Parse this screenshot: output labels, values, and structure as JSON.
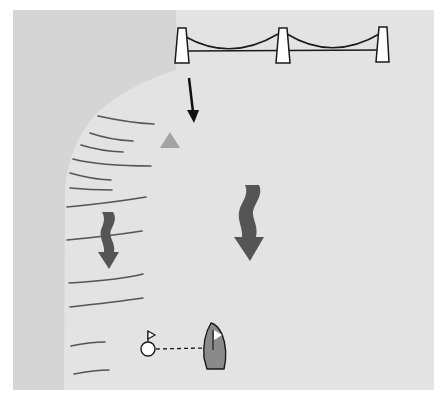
{
  "diagram": {
    "type": "sailing-navigation-illustration",
    "colors": {
      "background": "#ffffff",
      "water": "#e3e3e3",
      "land": "#d5d5d5",
      "outline": "#1a1a1a",
      "tower_fill": "#ffffff",
      "shore_lines": "#555555",
      "current_arrow": "#555555",
      "marker_triangle": "#a3a3a3",
      "boat_hull": "#8a8a8a",
      "flag": "#ffffff"
    },
    "elements": {
      "bridge": {
        "towers": 3,
        "label": ""
      },
      "direction_arrow": {
        "label": ""
      },
      "shore_marker": {
        "shape": "triangle"
      },
      "current_arrows": [
        {
          "position": "nearshore",
          "direction": "down"
        },
        {
          "position": "midstream",
          "direction": "down"
        }
      ],
      "shallow_water_lines": 11,
      "buoy": {
        "has_flag": true
      },
      "boat": {
        "has_flag": true
      },
      "connector": {
        "style": "dashed"
      }
    }
  }
}
